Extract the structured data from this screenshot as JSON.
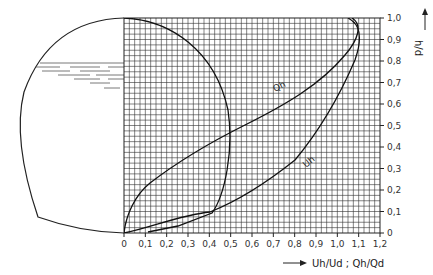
{
  "chart_data": {
    "type": "line",
    "title": "",
    "xlabel": "Uh/Ud ; Qh/Qd",
    "ylabel": "h/d",
    "xlim": [
      0,
      1.2
    ],
    "ylim": [
      0,
      1.0
    ],
    "grid": true,
    "x_ticks": [
      "0",
      "0,1",
      "0,2",
      "0,3",
      "0,4",
      "0,5",
      "0,6",
      "0,7",
      "0,8",
      "0,9",
      "1,0",
      "1,1",
      "1,2"
    ],
    "y_ticks": [
      "0",
      "0,1",
      "0,2",
      "0,3",
      "0,4",
      "0,5",
      "0,6",
      "0,7",
      "0,8",
      "0,9",
      "1,0"
    ],
    "series": [
      {
        "name": "Qh",
        "label": "Qh",
        "points": [
          [
            0,
            0
          ],
          [
            0.03,
            0.1
          ],
          [
            0.1,
            0.2
          ],
          [
            0.22,
            0.3
          ],
          [
            0.34,
            0.4
          ],
          [
            0.48,
            0.5
          ],
          [
            0.62,
            0.6
          ],
          [
            0.78,
            0.7
          ],
          [
            0.92,
            0.8
          ],
          [
            1.03,
            0.9
          ],
          [
            1.08,
            0.95
          ],
          [
            1.05,
            1.0
          ]
        ]
      },
      {
        "name": "Uh",
        "label": "Uh",
        "points": [
          [
            0,
            0
          ],
          [
            0.12,
            0.03
          ],
          [
            0.26,
            0.07
          ],
          [
            0.4,
            0.1
          ],
          [
            0.52,
            0.18
          ],
          [
            0.66,
            0.3
          ],
          [
            0.8,
            0.45
          ],
          [
            0.92,
            0.6
          ],
          [
            1.02,
            0.75
          ],
          [
            1.09,
            0.88
          ],
          [
            1.12,
            0.96
          ],
          [
            1.1,
            1.0
          ]
        ]
      },
      {
        "name": "pipe-circle",
        "label": "",
        "points": [
          [
            0,
            1.0
          ],
          [
            0.25,
            0.93
          ],
          [
            0.4,
            0.8
          ],
          [
            0.48,
            0.6
          ],
          [
            0.5,
            0.5
          ],
          [
            0.48,
            0.3
          ],
          [
            0.42,
            0.12
          ],
          [
            0.35,
            0.0
          ]
        ]
      }
    ],
    "annotations": [
      "h/d",
      "Uh/Ud ; Qh/Qd"
    ]
  },
  "labels": {
    "y_axis_title": "h/d",
    "x_axis_title": "Uh/Ud ; Qh/Qd",
    "curve_q": "Qh",
    "curve_u": "Uh"
  }
}
